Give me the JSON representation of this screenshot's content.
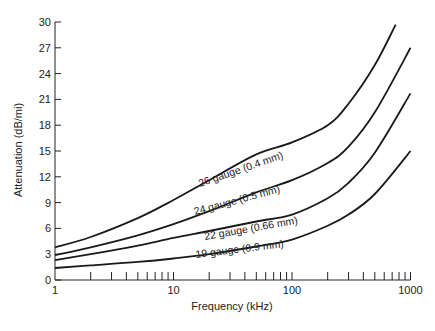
{
  "chart_data": {
    "type": "line",
    "title": "",
    "xlabel": "Frequency (kHz)",
    "ylabel": "Attenuation (dB/mi)",
    "xscale": "log",
    "xlim": [
      1,
      1000
    ],
    "ylim": [
      0,
      30
    ],
    "grid": false,
    "legend": "inline labels on curves",
    "x_tick_labels": [
      "1",
      "10",
      "100",
      "1000"
    ],
    "y_tick_labels": [
      "0",
      "3",
      "6",
      "9",
      "12",
      "15",
      "18",
      "21",
      "24",
      "27",
      "30"
    ],
    "series": [
      {
        "name": "26 gauge (0.4 mm)",
        "x": [
          1,
          2,
          5,
          10,
          20,
          50,
          100,
          200,
          300,
          500,
          750
        ],
        "values": [
          3.8,
          5.0,
          7.2,
          9.3,
          11.6,
          14.6,
          16.0,
          18.0,
          20.5,
          25.0,
          29.7
        ]
      },
      {
        "name": "24 gauge (0.5 mm)",
        "x": [
          1,
          2,
          5,
          10,
          20,
          50,
          100,
          200,
          300,
          500,
          1000
        ],
        "values": [
          2.9,
          3.8,
          5.2,
          6.5,
          8.0,
          10.2,
          11.6,
          13.6,
          15.5,
          19.5,
          27.0
        ]
      },
      {
        "name": "22 gauge (0.66 mm)",
        "x": [
          1,
          2,
          5,
          10,
          20,
          50,
          100,
          200,
          300,
          500,
          1000
        ],
        "values": [
          2.3,
          3.0,
          4.0,
          4.9,
          5.7,
          6.8,
          7.6,
          9.5,
          11.3,
          14.8,
          21.7
        ]
      },
      {
        "name": "19 gauge (0.9 mm)",
        "x": [
          1,
          2,
          5,
          10,
          20,
          50,
          100,
          200,
          300,
          500,
          1000
        ],
        "values": [
          1.4,
          1.7,
          2.1,
          2.5,
          3.0,
          3.9,
          4.7,
          6.3,
          7.6,
          10.0,
          15.0
        ]
      }
    ]
  },
  "labels": {
    "xlabel": "Frequency (kHz)",
    "ylabel": "Attenuation (dB/mi)",
    "curve_labels": [
      "26 gauge (0.4 mm)",
      "24 gauge (0.5 mm)",
      "22 gauge (0.66 mm)",
      "19 gauge (0.9 mm)"
    ]
  }
}
